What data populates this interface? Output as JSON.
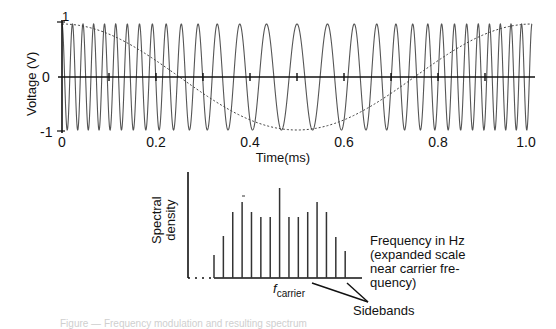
{
  "chart_data": [
    {
      "type": "line",
      "title": "",
      "xlabel": "Time(ms)",
      "ylabel": "Voltage (V)",
      "xlim": [
        0,
        1.0
      ],
      "ylim": [
        -1,
        1
      ],
      "x_ticks": [
        "0",
        "0.2",
        "0.4",
        "0.6",
        "0.8",
        "1.0"
      ],
      "y_ticks": [
        "1",
        "0",
        "-1"
      ],
      "grid": false,
      "legend": null,
      "series": [
        {
          "name": "FM signal",
          "style": "solid",
          "description": "Frequency-modulated carrier; instantaneous frequency follows modulating cosine",
          "carrier_frequency_khz": 30,
          "frequency_deviation_khz": 15,
          "amplitude": 1
        },
        {
          "name": "Modulating signal",
          "style": "dashed",
          "function": "cos(2*pi*t/1ms)",
          "amplitude": 1,
          "x": [
            0,
            0.25,
            0.5,
            0.75,
            1.0
          ],
          "values": [
            1,
            0,
            -1,
            0,
            1
          ]
        }
      ]
    },
    {
      "type": "bar",
      "title": "",
      "xlabel": "Frequency in Hz\n(expanded scale\nnear carrier fre-\nquency)",
      "ylabel": "Spectral\ndensity",
      "categories": [
        "-7",
        "-6",
        "-5",
        "-4",
        "-3",
        "-2",
        "-1",
        "0",
        "1",
        "2",
        "3",
        "4",
        "5",
        "6",
        "7"
      ],
      "values": [
        23,
        42,
        66,
        76,
        66,
        61,
        61,
        90,
        61,
        61,
        66,
        76,
        66,
        41,
        27
      ],
      "annotations": [
        {
          "text": "f",
          "subscript": "carrier",
          "target": "center line"
        },
        {
          "text": "Sidebands",
          "target": "outer lines"
        }
      ]
    }
  ],
  "labels": {
    "voltage_axis": "Voltage (V)",
    "time_axis": "Time(ms)",
    "y_top": "1",
    "y_zero": "0",
    "y_bottom": "-1",
    "spectral_line1": "Spectral",
    "spectral_line2": "density",
    "freq_note": "Frequency in Hz\n(expanded scale\nnear carrier fre-\nquency)",
    "fcarrier_f": "f",
    "fcarrier_sub": "carrier",
    "sidebands": "Sidebands",
    "caption": "Figure — Frequency modulation and resulting spectrum"
  },
  "colors": {
    "axis": "#111111",
    "wave": "#555555",
    "envelope": "#444444",
    "spectrum": "#333333"
  }
}
